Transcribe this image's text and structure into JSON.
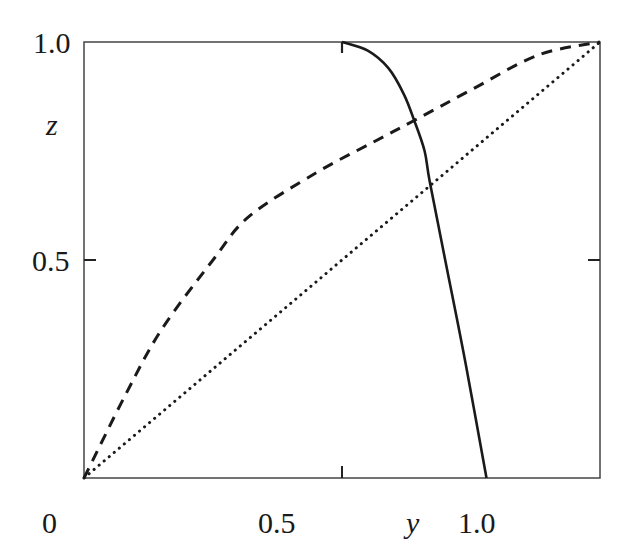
{
  "chart_data": {
    "type": "line",
    "title": "",
    "xlabel": "y",
    "ylabel": "z",
    "xlim": [
      0,
      1.0
    ],
    "ylim": [
      0,
      1.0
    ],
    "grid": false,
    "legend": null,
    "x_ticks": [
      "0",
      "0.5",
      "1.0"
    ],
    "y_ticks": [
      "0.5",
      "1.0"
    ],
    "series": [
      {
        "name": "solid",
        "style": "solid",
        "x": [
          0.5,
          0.55,
          0.59,
          0.62,
          0.64,
          0.66,
          0.67,
          0.7,
          0.74,
          0.78
        ],
        "y": [
          1.0,
          0.98,
          0.94,
          0.88,
          0.82,
          0.75,
          0.68,
          0.5,
          0.26,
          0.0
        ]
      },
      {
        "name": "dashed",
        "style": "dashed",
        "x": [
          0.0,
          0.08,
          0.15,
          0.25,
          0.32,
          0.45,
          0.56,
          0.64,
          0.75,
          0.88,
          1.0
        ],
        "y": [
          0.0,
          0.19,
          0.34,
          0.5,
          0.6,
          0.7,
          0.77,
          0.82,
          0.89,
          0.97,
          1.0
        ]
      },
      {
        "name": "dotted",
        "style": "dotted",
        "x": [
          0.0,
          1.0
        ],
        "y": [
          0.0,
          1.0
        ]
      }
    ]
  },
  "labels": {
    "x_tick_0": "0",
    "x_tick_05": "0.5",
    "x_tick_1": "1.0",
    "y_tick_05": "0.5",
    "y_tick_1": "1.0",
    "x_axis": "y",
    "y_axis": "z"
  }
}
